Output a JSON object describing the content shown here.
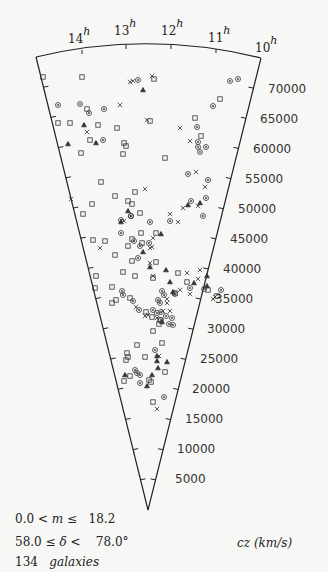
{
  "chart_data": {
    "type": "scatter",
    "title": "",
    "subtitle": "Wedge (cone) diagram of galaxy redshift survey",
    "xlabel": "Right Ascension (h)",
    "ylabel": "cz (km/s)",
    "ra_tick_labels": [
      "14",
      "13",
      "12",
      "11",
      "10"
    ],
    "ra_unit": "h",
    "cz_tick_labels": [
      "70000",
      "65000",
      "60000",
      "55000",
      "50000",
      "45000",
      "40000",
      "35000",
      "30000",
      "25000",
      "20000",
      "15000",
      "10000",
      "5000"
    ],
    "cz_range": [
      0,
      75000
    ],
    "cz_axis_label": "cz (km/s)",
    "legend": [
      {
        "marker": "square",
        "name": "galaxy (type 1)"
      },
      {
        "marker": "circle",
        "name": "galaxy (type 2)"
      },
      {
        "marker": "x",
        "name": "galaxy (type 3)"
      },
      {
        "marker": "triangle",
        "name": "galaxy (type 4)"
      }
    ],
    "selection": {
      "magnitude": "0.0 < m ≤ 18.2",
      "declination": "58.0 ≤ δ < 78.0°",
      "count": "134 galaxies"
    },
    "points_px": [
      [
        "s",
        43,
        77
      ],
      [
        "s",
        82,
        77
      ],
      [
        "c",
        138,
        80
      ],
      [
        "x",
        130,
        82
      ],
      [
        "x",
        133,
        81
      ],
      [
        "x",
        152,
        76
      ],
      [
        "s",
        154,
        79
      ],
      [
        "c",
        230,
        81
      ],
      [
        "c",
        238,
        79
      ],
      [
        "t",
        143,
        90
      ],
      [
        "c",
        58,
        105
      ],
      [
        "c",
        80,
        104
      ],
      [
        "s",
        87,
        109
      ],
      [
        "c",
        104,
        109
      ],
      [
        "x",
        120,
        105
      ],
      [
        "c",
        213,
        106
      ],
      [
        "s",
        220,
        99
      ],
      [
        "s",
        58,
        123
      ],
      [
        "s",
        70,
        123
      ],
      [
        "t",
        84,
        125
      ],
      [
        "x",
        87,
        132
      ],
      [
        "c",
        89,
        113
      ],
      [
        "s",
        81,
        153
      ],
      [
        "s",
        98,
        125
      ],
      [
        "s",
        117,
        128
      ],
      [
        "x",
        147,
        120
      ],
      [
        "s",
        195,
        118
      ],
      [
        "x",
        180,
        128
      ],
      [
        "t",
        68,
        144
      ],
      [
        "s",
        90,
        140
      ],
      [
        "t",
        96,
        143
      ],
      [
        "c",
        103,
        140
      ],
      [
        "s",
        124,
        143
      ],
      [
        "s",
        126,
        146
      ],
      [
        "s",
        123,
        154
      ],
      [
        "s",
        165,
        158
      ],
      [
        "s",
        150,
        121
      ],
      [
        "c",
        197,
        127
      ],
      [
        "x",
        190,
        141
      ],
      [
        "c",
        198,
        142
      ],
      [
        "s",
        201,
        136
      ],
      [
        "c",
        200,
        152
      ],
      [
        "c",
        198,
        147
      ],
      [
        "c",
        206,
        147
      ],
      [
        "x",
        71,
        199
      ],
      [
        "s",
        135,
        192
      ],
      [
        "s",
        115,
        196
      ],
      [
        "s",
        101,
        182
      ],
      [
        "s",
        128,
        201
      ],
      [
        "t",
        128,
        211
      ],
      [
        "s",
        132,
        204
      ],
      [
        "c",
        131,
        216
      ],
      [
        "x",
        145,
        189
      ],
      [
        "x",
        183,
        208
      ],
      [
        "x",
        196,
        172
      ],
      [
        "c",
        188,
        174
      ],
      [
        "x",
        205,
        187
      ],
      [
        "c",
        206,
        198
      ],
      [
        "c",
        208,
        180
      ],
      [
        "s",
        92,
        204
      ],
      [
        "s",
        83,
        214
      ],
      [
        "t",
        121,
        222
      ],
      [
        "c",
        121,
        220
      ],
      [
        "c",
        150,
        222
      ],
      [
        "x",
        124,
        221
      ],
      [
        "s",
        140,
        213
      ],
      [
        "c",
        131,
        216
      ],
      [
        "s",
        141,
        233
      ],
      [
        "t",
        161,
        234
      ],
      [
        "c",
        134,
        241
      ],
      [
        "x",
        150,
        248
      ],
      [
        "s",
        156,
        233
      ],
      [
        "x",
        153,
        238
      ],
      [
        "c",
        170,
        221
      ],
      [
        "x",
        178,
        222
      ],
      [
        "x",
        170,
        214
      ],
      [
        "t",
        188,
        205
      ],
      [
        "x",
        198,
        206
      ],
      [
        "t",
        200,
        203
      ],
      [
        "c",
        203,
        216
      ],
      [
        "c",
        191,
        201
      ],
      [
        "s",
        93,
        240
      ],
      [
        "s",
        105,
        241
      ],
      [
        "s",
        128,
        246
      ],
      [
        "x",
        100,
        248
      ],
      [
        "s",
        142,
        243
      ],
      [
        "c",
        149,
        243
      ],
      [
        "c",
        121,
        233
      ],
      [
        "s",
        132,
        239
      ],
      [
        "c",
        140,
        246
      ],
      [
        "x",
        152,
        247
      ],
      [
        "t",
        143,
        252
      ],
      [
        "c",
        138,
        258
      ],
      [
        "s",
        115,
        255
      ],
      [
        "s",
        132,
        261
      ],
      [
        "x",
        150,
        263
      ],
      [
        "s",
        156,
        262
      ],
      [
        "t",
        150,
        267
      ],
      [
        "x",
        200,
        270
      ],
      [
        "t",
        166,
        270
      ],
      [
        "x",
        187,
        273
      ],
      [
        "s",
        123,
        272
      ],
      [
        "s",
        96,
        276
      ],
      [
        "s",
        135,
        276
      ],
      [
        "s",
        153,
        278
      ],
      [
        "x",
        153,
        276
      ],
      [
        "t",
        170,
        282
      ],
      [
        "s",
        178,
        273
      ],
      [
        "c",
        175,
        294
      ],
      [
        "x",
        180,
        290
      ],
      [
        "x",
        198,
        279
      ],
      [
        "t",
        207,
        276
      ],
      [
        "t",
        194,
        283
      ],
      [
        "s",
        187,
        282
      ],
      [
        "c",
        190,
        288
      ],
      [
        "s",
        175,
        293
      ],
      [
        "s",
        112,
        287
      ],
      [
        "s",
        95,
        288
      ],
      [
        "c",
        122,
        291
      ],
      [
        "c",
        123,
        295
      ],
      [
        "t",
        173,
        292
      ],
      [
        "x",
        190,
        294
      ],
      [
        "c",
        204,
        289
      ],
      [
        "t",
        207,
        286
      ],
      [
        "s",
        208,
        290
      ],
      [
        "s",
        217,
        296
      ],
      [
        "x",
        215,
        297
      ],
      [
        "x",
        213,
        299
      ],
      [
        "c",
        221,
        290
      ],
      [
        "s",
        116,
        300
      ],
      [
        "s",
        130,
        298
      ],
      [
        "c",
        133,
        301
      ],
      [
        "x",
        136,
        307
      ],
      [
        "s",
        112,
        303
      ],
      [
        "c",
        158,
        300
      ],
      [
        "x",
        167,
        303
      ],
      [
        "c",
        160,
        303
      ],
      [
        "c",
        162,
        291
      ],
      [
        "c",
        164,
        295
      ],
      [
        "x",
        167,
        299
      ],
      [
        "c",
        161,
        312
      ],
      [
        "c",
        166,
        316
      ],
      [
        "x",
        145,
        316
      ],
      [
        "c",
        139,
        310
      ],
      [
        "s",
        146,
        312
      ],
      [
        "x",
        148,
        315
      ],
      [
        "c",
        153,
        310
      ],
      [
        "c",
        157,
        313
      ],
      [
        "s",
        152,
        317
      ],
      [
        "c",
        161,
        320
      ],
      [
        "x",
        157,
        318
      ],
      [
        "c",
        172,
        318
      ],
      [
        "c",
        173,
        325
      ],
      [
        "c",
        169,
        324
      ],
      [
        "x",
        170,
        311
      ],
      [
        "x",
        163,
        311
      ],
      [
        "s",
        160,
        320
      ],
      [
        "t",
        162,
        322
      ],
      [
        "s",
        159,
        324
      ],
      [
        "s",
        153,
        331
      ],
      [
        "s",
        162,
        343
      ],
      [
        "c",
        155,
        350
      ],
      [
        "s",
        145,
        357
      ],
      [
        "s",
        128,
        357
      ],
      [
        "s",
        127,
        353
      ],
      [
        "s",
        137,
        345
      ],
      [
        "t",
        157,
        361
      ],
      [
        "s",
        126,
        360
      ],
      [
        "s",
        124,
        381
      ],
      [
        "t",
        157,
        356
      ],
      [
        "x",
        159,
        356
      ],
      [
        "s",
        165,
        372
      ],
      [
        "s",
        151,
        382
      ],
      [
        "c",
        140,
        383
      ],
      [
        "c",
        140,
        375
      ],
      [
        "t",
        125,
        375
      ],
      [
        "s",
        130,
        376
      ],
      [
        "t",
        147,
        386
      ],
      [
        "t",
        167,
        362
      ],
      [
        "c",
        135,
        370
      ],
      [
        "c",
        137,
        373
      ],
      [
        "t",
        152,
        375
      ],
      [
        "s",
        149,
        380
      ],
      [
        "t",
        158,
        368
      ],
      [
        "c",
        164,
        397
      ],
      [
        "s",
        153,
        402
      ],
      [
        "x",
        157,
        409
      ]
    ]
  },
  "labels": {
    "ra": [
      {
        "num": "14",
        "sup": "h"
      },
      {
        "num": "13",
        "sup": "h"
      },
      {
        "num": "12",
        "sup": "h"
      },
      {
        "num": "11",
        "sup": "h"
      },
      {
        "num": "10",
        "sup": "h"
      }
    ],
    "cz": [
      "70000",
      "65000",
      "60000",
      "55000",
      "50000",
      "45000",
      "40000",
      "35000",
      "30000",
      "25000",
      "20000",
      "15000",
      "10000",
      "5000"
    ],
    "axis_label_prefix": "cz",
    "axis_label_unit": "(km/s)",
    "magnitude": {
      "low": "0.0",
      "op1": "<",
      "var": "m",
      "op2": "≤",
      "high": "18.2"
    },
    "declination": {
      "low": "58.0",
      "op1": "≤",
      "var": "δ",
      "op2": "<",
      "high": "78.0°"
    },
    "count": {
      "num": "134",
      "word": "galaxies"
    }
  }
}
